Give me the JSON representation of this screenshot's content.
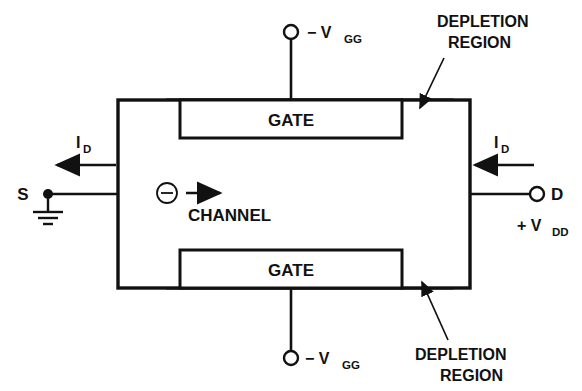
{
  "diagram": {
    "type": "semiconductor-device-cross-section",
    "colors": {
      "line": "#111111",
      "background": "#ffffff",
      "hatch": "#111111"
    },
    "body": {
      "label": "device-body",
      "x": 118,
      "y": 100,
      "width": 352,
      "height": 188
    },
    "gates": [
      {
        "id": "gate-top",
        "label": "GATE",
        "x": 180,
        "y": 100,
        "width": 222,
        "height": 38
      },
      {
        "id": "gate-bottom",
        "label": "GATE",
        "x": 180,
        "y": 250,
        "width": 222,
        "height": 38
      }
    ],
    "channel": {
      "label": "CHANNEL",
      "carrier_symbol": "−",
      "carrier_name": "electron",
      "flow_direction": "right"
    },
    "terminals": [
      {
        "id": "gate-top-terminal",
        "label": "− V",
        "subscript": "GG",
        "position": "top",
        "marker": "open-circle"
      },
      {
        "id": "gate-bottom-terminal",
        "label": "− V",
        "subscript": "GG",
        "position": "bottom",
        "marker": "open-circle"
      },
      {
        "id": "source-terminal",
        "label": "S",
        "position": "left",
        "marker": "filled-dot",
        "grounded": true
      },
      {
        "id": "drain-terminal",
        "label": "D",
        "position": "right",
        "marker": "open-circle"
      }
    ],
    "supply": {
      "label": "+ V",
      "subscript": "DD"
    },
    "currents": [
      {
        "id": "current-source",
        "label": "I",
        "subscript": "D",
        "arrow_direction": "left",
        "side": "left"
      },
      {
        "id": "current-drain",
        "label": "I",
        "subscript": "D",
        "arrow_direction": "left",
        "side": "right"
      }
    ],
    "annotations": [
      {
        "id": "depletion-top",
        "line1": "DEPLETION",
        "line2": "REGION",
        "position": "top-right",
        "leader": "arrow-down-left"
      },
      {
        "id": "depletion-bottom",
        "line1": "DEPLETION",
        "line2": "REGION",
        "position": "bottom-right",
        "leader": "arrow-up-left"
      }
    ]
  }
}
